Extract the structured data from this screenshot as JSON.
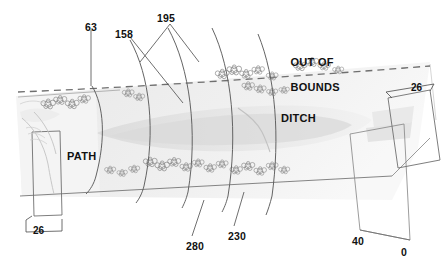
{
  "diagram": {
    "kind": "golf-hole-layout",
    "background_color": "#ffffff",
    "line_color": "#6f6f6f",
    "text_color": "#111111",
    "fairway_color": "#e3e3e3",
    "rough_color": "#ededed",
    "green_color": "#d3d3d3",
    "dash_color": "#7a7a7a"
  },
  "area_labels": [
    {
      "id": "out-of-bounds",
      "line1": "OUT OF",
      "line2": "BOUNDS",
      "x": 277,
      "y": 44
    },
    {
      "id": "ditch",
      "text": "DITCH",
      "x": 281,
      "y": 112
    },
    {
      "id": "path",
      "text": "PATH",
      "x": 67,
      "y": 150
    }
  ],
  "yardage_markers": [
    {
      "id": "marker-63",
      "value": "63",
      "x": 85,
      "y": 22
    },
    {
      "id": "marker-158",
      "value": "158",
      "x": 115,
      "y": 29
    },
    {
      "id": "marker-195",
      "value": "195",
      "x": 157,
      "y": 13
    },
    {
      "id": "marker-280",
      "value": "280",
      "x": 186,
      "y": 241
    },
    {
      "id": "marker-230",
      "value": "230",
      "x": 228,
      "y": 231
    }
  ],
  "tee_markers": [
    {
      "id": "tee-40",
      "value": "40",
      "x": 352,
      "y": 236
    },
    {
      "id": "tee-0",
      "value": "0",
      "x": 401,
      "y": 247
    }
  ],
  "dimensions": [
    {
      "id": "dim-green-width",
      "value": "26",
      "x": 33,
      "y": 225,
      "note": "green/path width dimension, lower left"
    },
    {
      "id": "dim-tee-width",
      "value": "26",
      "x": 411,
      "y": 88,
      "note": "tee box width dimension, upper right"
    }
  ]
}
